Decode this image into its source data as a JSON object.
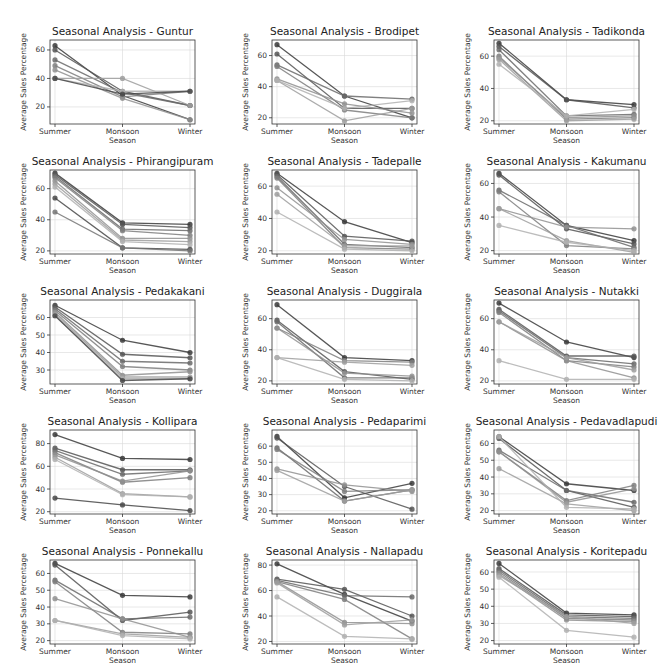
{
  "figure": {
    "season_label": "Season",
    "ylabel": "Average Sales Percentage"
  },
  "chart_data": [
    {
      "type": "line",
      "title": "Seasonal Analysis - Guntur",
      "categories": [
        "Summer",
        "Monsoon",
        "Winter"
      ],
      "xlabel": "Season",
      "ylabel": "Average Sales Percentage",
      "ylim": [
        8,
        67
      ],
      "yticks": [
        20,
        40,
        60
      ],
      "grid": true,
      "series": [
        {
          "values": [
            63,
            28,
            11
          ]
        },
        {
          "values": [
            60,
            31,
            21
          ]
        },
        {
          "values": [
            53,
            30,
            21
          ]
        },
        {
          "values": [
            49,
            27,
            31
          ]
        },
        {
          "values": [
            46,
            26,
            11
          ]
        },
        {
          "values": [
            40,
            40,
            21
          ]
        },
        {
          "values": [
            40,
            31,
            31
          ]
        },
        {
          "values": [
            40,
            29,
            31
          ]
        }
      ]
    },
    {
      "type": "line",
      "title": "Seasonal Analysis - Brodipet",
      "categories": [
        "Summer",
        "Monsoon",
        "Winter"
      ],
      "xlabel": "Season",
      "ylabel": "Average Sales Percentage",
      "ylim": [
        16,
        70
      ],
      "yticks": [
        20,
        40,
        60
      ],
      "grid": true,
      "series": [
        {
          "values": [
            67,
            34,
            20
          ]
        },
        {
          "values": [
            61,
            26,
            26
          ]
        },
        {
          "values": [
            54,
            34,
            32
          ]
        },
        {
          "values": [
            53,
            25,
            20
          ]
        },
        {
          "values": [
            45,
            29,
            23
          ]
        },
        {
          "values": [
            44,
            18,
            26
          ]
        },
        {
          "values": [
            44,
            26,
            31
          ]
        }
      ]
    },
    {
      "type": "line",
      "title": "Seasonal Analysis - Tadikonda",
      "categories": [
        "Summer",
        "Monsoon",
        "Winter"
      ],
      "xlabel": "Season",
      "ylabel": "Average Sales Percentage",
      "ylim": [
        18,
        70
      ],
      "yticks": [
        20,
        40,
        60
      ],
      "grid": true,
      "series": [
        {
          "values": [
            68,
            33,
            30
          ]
        },
        {
          "values": [
            66,
            33,
            28
          ]
        },
        {
          "values": [
            64,
            23,
            24
          ]
        },
        {
          "values": [
            60,
            21,
            22
          ]
        },
        {
          "values": [
            59,
            22,
            23
          ]
        },
        {
          "values": [
            58,
            20,
            21
          ]
        },
        {
          "values": [
            55,
            23,
            27
          ]
        }
      ]
    },
    {
      "type": "line",
      "title": "Seasonal Analysis - Phirangipuram",
      "categories": [
        "Summer",
        "Monsoon",
        "Winter"
      ],
      "xlabel": "Season",
      "ylabel": "Average Sales Percentage",
      "ylim": [
        18,
        72
      ],
      "yticks": [
        20,
        40,
        60
      ],
      "grid": true,
      "series": [
        {
          "values": [
            70,
            38,
            37
          ]
        },
        {
          "values": [
            69,
            37,
            35
          ]
        },
        {
          "values": [
            68,
            34,
            33
          ]
        },
        {
          "values": [
            67,
            33,
            30
          ]
        },
        {
          "values": [
            65,
            28,
            28
          ]
        },
        {
          "values": [
            63,
            27,
            26
          ]
        },
        {
          "values": [
            61,
            26,
            24
          ]
        },
        {
          "values": [
            54,
            22,
            21
          ]
        },
        {
          "values": [
            45,
            22,
            20
          ]
        }
      ]
    },
    {
      "type": "line",
      "title": "Seasonal Analysis - Tadepalle",
      "categories": [
        "Summer",
        "Monsoon",
        "Winter"
      ],
      "xlabel": "Season",
      "ylabel": "Average Sales Percentage",
      "ylim": [
        18,
        70
      ],
      "yticks": [
        20,
        40,
        60
      ],
      "grid": true,
      "series": [
        {
          "values": [
            68,
            38,
            25
          ]
        },
        {
          "values": [
            67,
            29,
            26
          ]
        },
        {
          "values": [
            66,
            24,
            22
          ]
        },
        {
          "values": [
            65,
            22,
            21
          ]
        },
        {
          "values": [
            59,
            27,
            24
          ]
        },
        {
          "values": [
            55,
            23,
            23
          ]
        },
        {
          "values": [
            44,
            21,
            20
          ]
        }
      ]
    },
    {
      "type": "line",
      "title": "Seasonal Analysis - Kakumanu",
      "categories": [
        "Summer",
        "Monsoon",
        "Winter"
      ],
      "xlabel": "Season",
      "ylabel": "Average Sales Percentage",
      "ylim": [
        18,
        68
      ],
      "yticks": [
        20,
        40,
        60
      ],
      "grid": true,
      "series": [
        {
          "values": [
            66,
            35,
            26
          ]
        },
        {
          "values": [
            65,
            33,
            24
          ]
        },
        {
          "values": [
            56,
            35,
            22
          ]
        },
        {
          "values": [
            55,
            23,
            21
          ]
        },
        {
          "values": [
            45,
            34,
            33
          ]
        },
        {
          "values": [
            45,
            26,
            19
          ]
        },
        {
          "values": [
            35,
            25,
            20
          ]
        }
      ]
    },
    {
      "type": "line",
      "title": "Seasonal Analysis - Pedakakani",
      "categories": [
        "Summer",
        "Monsoon",
        "Winter"
      ],
      "xlabel": "Season",
      "ylabel": "Average Sales Percentage",
      "ylim": [
        22,
        70
      ],
      "yticks": [
        30,
        40,
        50,
        60
      ],
      "grid": true,
      "series": [
        {
          "values": [
            67,
            47,
            40
          ]
        },
        {
          "values": [
            66,
            39,
            37
          ]
        },
        {
          "values": [
            65,
            35,
            34
          ]
        },
        {
          "values": [
            64,
            32,
            30
          ]
        },
        {
          "values": [
            63,
            27,
            29
          ]
        },
        {
          "values": [
            62,
            26,
            26
          ]
        },
        {
          "values": [
            61,
            25,
            25
          ]
        },
        {
          "values": [
            61,
            24,
            25
          ]
        }
      ]
    },
    {
      "type": "line",
      "title": "Seasonal Analysis - Duggirala",
      "categories": [
        "Summer",
        "Monsoon",
        "Winter"
      ],
      "xlabel": "Season",
      "ylabel": "Average Sales Percentage",
      "ylim": [
        18,
        72
      ],
      "yticks": [
        20,
        40,
        60
      ],
      "grid": true,
      "series": [
        {
          "values": [
            69,
            35,
            33
          ]
        },
        {
          "values": [
            59,
            26,
            21
          ]
        },
        {
          "values": [
            58,
            22,
            22
          ]
        },
        {
          "values": [
            54,
            33,
            32
          ]
        },
        {
          "values": [
            54,
            25,
            23
          ]
        },
        {
          "values": [
            35,
            32,
            30
          ]
        },
        {
          "values": [
            35,
            21,
            20
          ]
        }
      ]
    },
    {
      "type": "line",
      "title": "Seasonal Analysis - Nutakki",
      "categories": [
        "Summer",
        "Monsoon",
        "Winter"
      ],
      "xlabel": "Season",
      "ylabel": "Average Sales Percentage",
      "ylim": [
        18,
        72
      ],
      "yticks": [
        20,
        40,
        60
      ],
      "grid": true,
      "series": [
        {
          "values": [
            70,
            45,
            35
          ]
        },
        {
          "values": [
            66,
            36,
            36
          ]
        },
        {
          "values": [
            65,
            35,
            31
          ]
        },
        {
          "values": [
            64,
            33,
            29
          ]
        },
        {
          "values": [
            58,
            33,
            22
          ]
        },
        {
          "values": [
            58,
            35,
            27
          ]
        },
        {
          "values": [
            33,
            21,
            21
          ]
        }
      ]
    },
    {
      "type": "line",
      "title": "Seasonal Analysis - Kollipara",
      "categories": [
        "Summer",
        "Monsoon",
        "Winter"
      ],
      "xlabel": "Season",
      "ylabel": "Average Sales Percentage",
      "ylim": [
        18,
        92
      ],
      "yticks": [
        20,
        40,
        60,
        80
      ],
      "grid": true,
      "series": [
        {
          "values": [
            88,
            67,
            66
          ]
        },
        {
          "values": [
            76,
            57,
            57
          ]
        },
        {
          "values": [
            74,
            53,
            56
          ]
        },
        {
          "values": [
            72,
            46,
            50
          ]
        },
        {
          "values": [
            70,
            47,
            56
          ]
        },
        {
          "values": [
            68,
            36,
            33
          ]
        },
        {
          "values": [
            66,
            35,
            33
          ]
        },
        {
          "values": [
            32,
            26,
            21
          ]
        }
      ]
    },
    {
      "type": "line",
      "title": "Seasonal Analysis - Pedaparimi",
      "categories": [
        "Summer",
        "Monsoon",
        "Winter"
      ],
      "xlabel": "Season",
      "ylabel": "Average Sales Percentage",
      "ylim": [
        18,
        70
      ],
      "yticks": [
        20,
        30,
        40,
        50,
        60
      ],
      "grid": true,
      "series": [
        {
          "values": [
            66,
            28,
            37
          ]
        },
        {
          "values": [
            65,
            35,
            21
          ]
        },
        {
          "values": [
            59,
            26,
            33
          ]
        },
        {
          "values": [
            58,
            32,
            33
          ]
        },
        {
          "values": [
            46,
            36,
            32
          ]
        },
        {
          "values": [
            45,
            26,
            33
          ]
        }
      ]
    },
    {
      "type": "line",
      "title": "Seasonal Analysis - Pedavadlapudi",
      "categories": [
        "Summer",
        "Monsoon",
        "Winter"
      ],
      "xlabel": "Season",
      "ylabel": "Average Sales Percentage",
      "ylim": [
        18,
        68
      ],
      "yticks": [
        20,
        30,
        40,
        50,
        60
      ],
      "grid": true,
      "series": [
        {
          "values": [
            64,
            36,
            32
          ]
        },
        {
          "values": [
            63,
            32,
            22
          ]
        },
        {
          "values": [
            56,
            32,
            25
          ]
        },
        {
          "values": [
            55,
            26,
            35
          ]
        },
        {
          "values": [
            55,
            25,
            33
          ]
        },
        {
          "values": [
            45,
            24,
            20
          ]
        },
        {
          "values": [
            64,
            22,
            21
          ]
        }
      ]
    },
    {
      "type": "line",
      "title": "Seasonal Analysis - Ponnekallu",
      "categories": [
        "Summer",
        "Monsoon",
        "Winter"
      ],
      "xlabel": "Season",
      "ylabel": "Average Sales Percentage",
      "ylim": [
        18,
        68
      ],
      "yticks": [
        20,
        30,
        40,
        50,
        60
      ],
      "grid": true,
      "series": [
        {
          "values": [
            66,
            47,
            46
          ]
        },
        {
          "values": [
            65,
            32,
            37
          ]
        },
        {
          "values": [
            56,
            33,
            34
          ]
        },
        {
          "values": [
            55,
            25,
            24
          ]
        },
        {
          "values": [
            45,
            33,
            22
          ]
        },
        {
          "values": [
            32,
            24,
            22
          ]
        },
        {
          "values": [
            32,
            23,
            21
          ]
        }
      ]
    },
    {
      "type": "line",
      "title": "Seasonal Analysis - Nallapadu",
      "categories": [
        "Summer",
        "Monsoon",
        "Winter"
      ],
      "xlabel": "Season",
      "ylabel": "Average Sales Percentage",
      "ylim": [
        18,
        84
      ],
      "yticks": [
        20,
        40,
        60,
        80
      ],
      "grid": true,
      "series": [
        {
          "values": [
            81,
            57,
            36
          ]
        },
        {
          "values": [
            69,
            61,
            40
          ]
        },
        {
          "values": [
            68,
            56,
            55
          ]
        },
        {
          "values": [
            67,
            53,
            22
          ]
        },
        {
          "values": [
            67,
            35,
            34
          ]
        },
        {
          "values": [
            66,
            33,
            37
          ]
        },
        {
          "values": [
            55,
            24,
            22
          ]
        }
      ]
    },
    {
      "type": "line",
      "title": "Seasonal Analysis - Koritepadu",
      "categories": [
        "Summer",
        "Monsoon",
        "Winter"
      ],
      "xlabel": "Season",
      "ylabel": "Average Sales Percentage",
      "ylim": [
        18,
        67
      ],
      "yticks": [
        20,
        30,
        40,
        50,
        60
      ],
      "grid": true,
      "series": [
        {
          "values": [
            65,
            36,
            35
          ]
        },
        {
          "values": [
            62,
            35,
            34
          ]
        },
        {
          "values": [
            61,
            34,
            33
          ]
        },
        {
          "values": [
            60,
            33,
            32
          ]
        },
        {
          "values": [
            59,
            32,
            31
          ]
        },
        {
          "values": [
            58,
            34,
            30
          ]
        },
        {
          "values": [
            57,
            26,
            22
          ]
        }
      ]
    }
  ],
  "colors": {
    "line_shades": [
      "#3a3a3a",
      "#555555",
      "#6a6a6a",
      "#7e7e7e",
      "#909090",
      "#9e9e9e",
      "#b0b0b0",
      "#484848",
      "#747474"
    ],
    "grid": "#d8d8d8",
    "frame": "#333333"
  }
}
